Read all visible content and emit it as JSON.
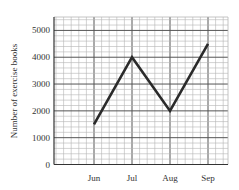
{
  "chart_data": {
    "type": "line",
    "title": "",
    "xlabel": "",
    "ylabel": "Number of exercise books",
    "categories": [
      "Jun",
      "Jul",
      "Aug",
      "Sep"
    ],
    "values": [
      1500,
      4000,
      2000,
      4500
    ],
    "series": [
      {
        "name": "Number of exercise books",
        "values": [
          1500,
          4000,
          2000,
          4500
        ]
      }
    ],
    "yticks": [
      0,
      1000,
      2000,
      3000,
      4000,
      5000
    ],
    "ylim": [
      0,
      5500
    ],
    "grid": true,
    "legend": null
  },
  "colors": {
    "line": "#2a2a2a",
    "grid_minor": "#b5b5b5",
    "grid_major": "#555555",
    "axis": "#333333"
  }
}
